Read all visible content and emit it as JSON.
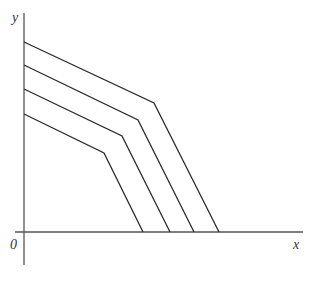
{
  "diagram": {
    "axes": {
      "x_label": "x",
      "y_label": "y",
      "origin_label": "0",
      "color": "#555555"
    },
    "line_color": "#2a2a2a",
    "lines": [
      {
        "id": "line-1",
        "start": [
          24,
          42
        ],
        "knee": [
          154,
          103
        ],
        "end": [
          219,
          232
        ]
      },
      {
        "id": "line-2",
        "start": [
          24,
          65
        ],
        "knee": [
          138,
          120
        ],
        "end": [
          194,
          232
        ]
      },
      {
        "id": "line-3",
        "start": [
          24,
          89
        ],
        "knee": [
          122,
          136
        ],
        "end": [
          170,
          232
        ]
      },
      {
        "id": "line-4",
        "start": [
          24,
          114
        ],
        "knee": [
          104,
          153
        ],
        "end": [
          143,
          232
        ]
      }
    ]
  }
}
